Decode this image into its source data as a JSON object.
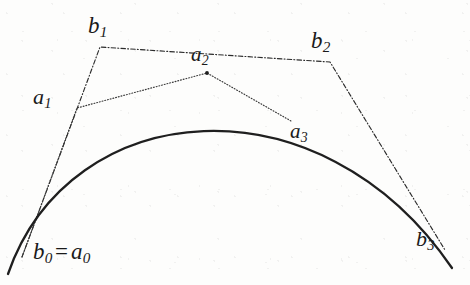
{
  "figure": {
    "width": 470,
    "height": 285,
    "background_color": "#fdfdfc",
    "ink_color": "#1a1a1a"
  },
  "labels": {
    "b0_eq_a0": {
      "base1": "b",
      "sub1": "0",
      "eq": "=",
      "base2": "a",
      "sub2": "0"
    },
    "b1": {
      "base": "b",
      "sub": "1"
    },
    "b2": {
      "base": "b",
      "sub": "2"
    },
    "b3": {
      "base": "b",
      "sub": "3"
    },
    "a1": {
      "base": "a",
      "sub": "1"
    },
    "a2": {
      "base": "a",
      "sub": "2"
    },
    "a3": {
      "base": "a",
      "sub": "3"
    }
  },
  "geometry": {
    "curve": {
      "name": "bezier-curve",
      "style": "solid",
      "stroke_width": 2.2,
      "color": "#1f1f1f",
      "start": [
        8,
        274
      ],
      "control1": [
        70,
        95
      ],
      "control2": [
        320,
        74
      ],
      "end": [
        452,
        268
      ]
    },
    "polygon_b": {
      "name": "control-polygon-b",
      "style": "dash-dot",
      "stroke_width": 1.1,
      "color": "#2b2b2b",
      "points": [
        [
          22,
          257
        ],
        [
          100,
          47
        ],
        [
          330,
          62
        ],
        [
          445,
          250
        ]
      ],
      "vertex_labels": [
        "b0_eq_a0",
        "b1",
        "b2",
        "b3"
      ]
    },
    "polygon_a": {
      "name": "control-polygon-a",
      "style": "dotted",
      "stroke_width": 1.1,
      "color": "#3a3a3a",
      "points": [
        [
          22,
          257
        ],
        [
          77,
          108
        ],
        [
          207,
          73
        ],
        [
          291,
          121
        ]
      ],
      "vertex_labels": [
        "b0_eq_a0",
        "a1",
        "a2",
        "a3"
      ]
    },
    "vertex_dots": [
      {
        "name": "dot-a2",
        "x": 207,
        "y": 73,
        "r": 1.9
      }
    ]
  }
}
